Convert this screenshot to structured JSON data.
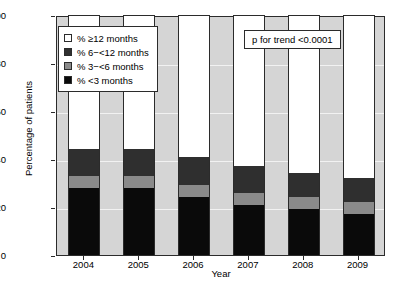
{
  "chart_data": {
    "type": "bar",
    "subtype": "stacked-bar-100",
    "title": "",
    "xlabel": "Year",
    "ylabel": "Percentage of patients",
    "categories": [
      "2004",
      "2005",
      "2006",
      "2007",
      "2008",
      "2009"
    ],
    "ylim": [
      0,
      100
    ],
    "yticks": [
      0,
      20,
      40,
      60,
      80,
      100
    ],
    "grid": true,
    "legend_position": "upper-left-inside",
    "series": [
      {
        "name": "% ≥12 months",
        "key": "ge12",
        "color": "#ffffff",
        "values": [
          56,
          56,
          59,
          63,
          66,
          68
        ]
      },
      {
        "name": "% 6−<12 months",
        "key": "m6to12",
        "color": "#2f2f2f",
        "values": [
          11,
          11,
          12,
          11,
          10,
          10
        ]
      },
      {
        "name": "% 3−<6 months",
        "key": "m3to6",
        "color": "#8a8a8a",
        "values": [
          5,
          5,
          5,
          5,
          5,
          5
        ]
      },
      {
        "name": "% <3 months",
        "key": "lt3",
        "color": "#0a0a0a",
        "values": [
          28,
          28,
          24,
          21,
          19,
          17
        ]
      }
    ],
    "annotations": [
      {
        "name": "p-for-trend",
        "text": "p for trend <0.0001"
      }
    ]
  },
  "axes": {
    "y_title": "Percentage of patients",
    "x_title": "Year",
    "y_ticks": [
      "100",
      "80",
      "60",
      "40",
      "20",
      "0"
    ],
    "x_ticks": [
      "2004",
      "2005",
      "2006",
      "2007",
      "2008",
      "2009"
    ]
  },
  "legend": {
    "items": [
      {
        "label": "% ≥12 months",
        "swatch": "white-swatch"
      },
      {
        "label": "% 6−<12 months",
        "swatch": "dark-gray-swatch"
      },
      {
        "label": "% 3−<6 months",
        "swatch": "medium-gray-swatch"
      },
      {
        "label": "% <3 months",
        "swatch": "black-swatch"
      }
    ]
  },
  "annotation": {
    "p_trend": "p for trend <0.0001"
  },
  "colors": {
    "plot_background": "#d5d5d5",
    "gridline": "#f2f2f2",
    "axis": "#2b2b2b",
    "seg_ge12": "#ffffff",
    "seg_6to12": "#2f2f2f",
    "seg_3to6": "#8a8a8a",
    "seg_lt3": "#0a0a0a"
  }
}
